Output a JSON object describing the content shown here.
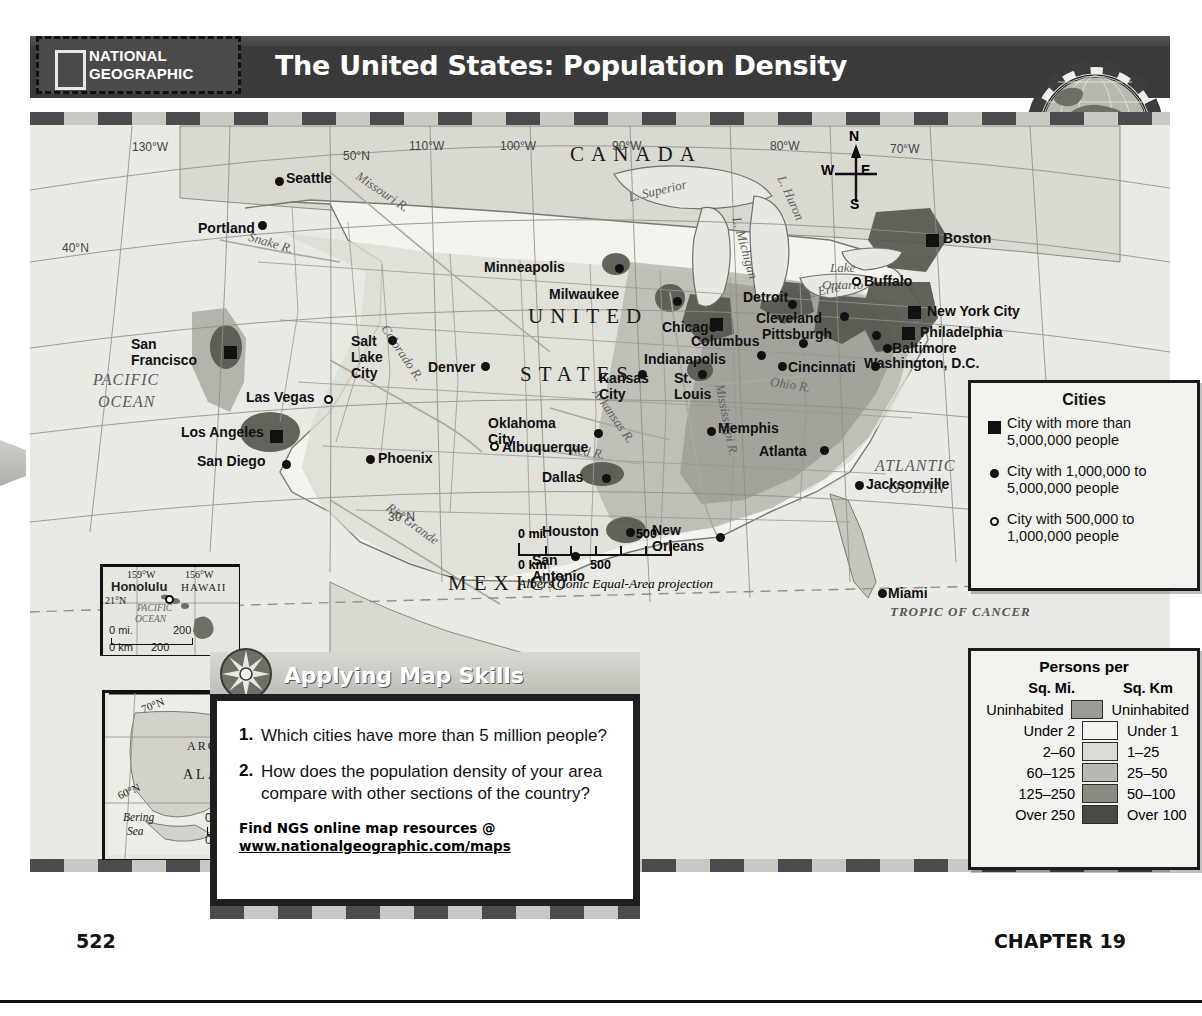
{
  "publisher": {
    "line1": "NATIONAL",
    "line2": "GEOGRAPHIC",
    "logo_icon": "ng-rectangle-logo"
  },
  "header": {
    "title": "The United States: Population Density"
  },
  "globe": {
    "icon": "globe-locator-icon"
  },
  "map": {
    "projection_note": "Albers Conic Equal-Area projection",
    "countries": [
      {
        "name": "CANADA",
        "x": 540,
        "y": 30
      },
      {
        "name": "UNITED",
        "x": 498,
        "y": 192
      },
      {
        "name": "STATES",
        "x": 490,
        "y": 250
      },
      {
        "name": "MEXICO",
        "x": 418,
        "y": 459
      }
    ],
    "oceans": [
      {
        "name": "PACIFIC",
        "x": 63,
        "y": 259
      },
      {
        "name": "OCEAN",
        "x": 68,
        "y": 281
      },
      {
        "name": "ATLANTIC",
        "x": 845,
        "y": 345
      },
      {
        "name": "OCEAN",
        "x": 858,
        "y": 367
      }
    ],
    "waters": [
      {
        "name": "L. Superior",
        "x": 598,
        "y": 71,
        "rot": -13
      },
      {
        "name": "L. Michigan",
        "x": 683,
        "y": 128,
        "rot": 74
      },
      {
        "name": "L. Huron",
        "x": 737,
        "y": 78,
        "rot": 66
      },
      {
        "name": "L. Erie",
        "x": 774,
        "y": 171,
        "rot": -12
      },
      {
        "name": "Lake",
        "x": 800,
        "y": 148,
        "rot": 0
      },
      {
        "name": "Ontario",
        "x": 792,
        "y": 165,
        "rot": 0
      },
      {
        "name": "Missouri R.",
        "x": 322,
        "y": 72,
        "rot": 34
      },
      {
        "name": "Snake R.",
        "x": 218,
        "y": 123,
        "rot": 16
      },
      {
        "name": "Colorado R.",
        "x": 340,
        "y": 233,
        "rot": 56
      },
      {
        "name": "Arkansas R.",
        "x": 552,
        "y": 296,
        "rot": 55
      },
      {
        "name": "Red R.",
        "x": 540,
        "y": 332,
        "rot": 10
      },
      {
        "name": "Mississippi R.",
        "x": 660,
        "y": 300,
        "rot": 79
      },
      {
        "name": "Ohio R.",
        "x": 740,
        "y": 265,
        "rot": 9
      },
      {
        "name": "Rio Grande",
        "x": 352,
        "y": 404,
        "rot": 36
      }
    ],
    "graticule": [
      {
        "label": "130°W",
        "x": 102,
        "y": 28
      },
      {
        "label": "50°N",
        "x": 313,
        "y": 37
      },
      {
        "label": "110°W",
        "x": 379,
        "y": 27
      },
      {
        "label": "100°W",
        "x": 470,
        "y": 27
      },
      {
        "label": "90°W",
        "x": 582,
        "y": 27
      },
      {
        "label": "80°W",
        "x": 740,
        "y": 27
      },
      {
        "label": "70°W",
        "x": 860,
        "y": 30
      },
      {
        "label": "40°N",
        "x": 32,
        "y": 129
      },
      {
        "label": "30°N",
        "x": 358,
        "y": 398
      },
      {
        "label": "TROPIC OF CANCER",
        "x": 860,
        "y": 492
      }
    ],
    "compass": {
      "n": "N",
      "e": "E",
      "s": "S",
      "w": "W",
      "x": 795,
      "y": 28
    },
    "scale": {
      "mi_zero": "0 mi.",
      "mi_max": "500",
      "km_zero": "0 km",
      "km_max": "500"
    },
    "cities": [
      {
        "name": "Seattle",
        "marker": "dot",
        "mx": 245,
        "my": 65,
        "lx": 256,
        "ly": 58
      },
      {
        "name": "Portland",
        "marker": "dot",
        "mx": 228,
        "my": 109,
        "lx": 168,
        "ly": 108
      },
      {
        "name": "San\nFrancisco",
        "marker": "sq",
        "mx": 194,
        "my": 234,
        "lx": 101,
        "ly": 224
      },
      {
        "name": "Los Angeles",
        "marker": "sq",
        "mx": 240,
        "my": 318,
        "lx": 151,
        "ly": 312
      },
      {
        "name": "San Diego",
        "marker": "dot",
        "mx": 252,
        "my": 348,
        "lx": 167,
        "ly": 341
      },
      {
        "name": "Las Vegas",
        "marker": "open",
        "mx": 294,
        "my": 283,
        "lx": 216,
        "ly": 277
      },
      {
        "name": "Salt\nLake\nCity",
        "marker": "dot",
        "mx": 358,
        "my": 224,
        "lx": 321,
        "ly": 221
      },
      {
        "name": "Phoenix",
        "marker": "dot",
        "mx": 336,
        "my": 343,
        "lx": 348,
        "ly": 338
      },
      {
        "name": "Albuquerque",
        "marker": "open",
        "mx": 460,
        "my": 330,
        "lx": 472,
        "ly": 327
      },
      {
        "name": "Denver",
        "marker": "dot",
        "mx": 451,
        "my": 250,
        "lx": 398,
        "ly": 247
      },
      {
        "name": "Minneapolis",
        "marker": "dot",
        "mx": 585,
        "my": 152,
        "lx": 454,
        "ly": 147
      },
      {
        "name": "Milwaukee",
        "marker": "dot",
        "mx": 643,
        "my": 185,
        "lx": 519,
        "ly": 174
      },
      {
        "name": "Chicago",
        "marker": "sq",
        "mx": 680,
        "my": 206,
        "lx": 632,
        "ly": 207
      },
      {
        "name": "Detroit",
        "marker": "dot",
        "mx": 758,
        "my": 188,
        "lx": 713,
        "ly": 177
      },
      {
        "name": "Indianapolis",
        "marker": "dot",
        "mx": 727,
        "my": 239,
        "lx": 614,
        "ly": 239
      },
      {
        "name": "Columbus",
        "marker": "dot",
        "mx": 769,
        "my": 227,
        "lx": 661,
        "ly": 221
      },
      {
        "name": "Cincinnati",
        "marker": "dot",
        "mx": 748,
        "my": 250,
        "lx": 758,
        "ly": 247
      },
      {
        "name": "Cleveland",
        "marker": "dot",
        "mx": 810,
        "my": 200,
        "lx": 726,
        "ly": 198
      },
      {
        "name": "Pittsburgh",
        "marker": "dot",
        "mx": 842,
        "my": 219,
        "lx": 732,
        "ly": 214
      },
      {
        "name": "Buffalo",
        "marker": "open",
        "mx": 822,
        "my": 165,
        "lx": 834,
        "ly": 161
      },
      {
        "name": "Boston",
        "marker": "sq",
        "mx": 896,
        "my": 122,
        "lx": 913,
        "ly": 118
      },
      {
        "name": "New York City",
        "marker": "sq",
        "mx": 878,
        "my": 194,
        "lx": 897,
        "ly": 191
      },
      {
        "name": "Philadelphia",
        "marker": "sq",
        "mx": 872,
        "my": 215,
        "lx": 890,
        "ly": 212
      },
      {
        "name": "Baltimore",
        "marker": "dot",
        "mx": 853,
        "my": 232,
        "lx": 862,
        "ly": 228
      },
      {
        "name": "Washington, D.C.",
        "marker": "dot",
        "mx": 841,
        "my": 250,
        "lx": 834,
        "ly": 243
      },
      {
        "name": "Kansas\nCity",
        "marker": "dot",
        "mx": 608,
        "my": 258,
        "lx": 569,
        "ly": 258
      },
      {
        "name": "St.\nLouis",
        "marker": "dot",
        "mx": 668,
        "my": 258,
        "lx": 644,
        "ly": 258
      },
      {
        "name": "Memphis",
        "marker": "dot",
        "mx": 677,
        "my": 315,
        "lx": 688,
        "ly": 308
      },
      {
        "name": "Oklahoma\nCity",
        "marker": "dot",
        "mx": 564,
        "my": 317,
        "lx": 458,
        "ly": 303
      },
      {
        "name": "Dallas",
        "marker": "dot",
        "mx": 572,
        "my": 362,
        "lx": 512,
        "ly": 357
      },
      {
        "name": "Houston",
        "marker": "dot",
        "mx": 596,
        "my": 416,
        "lx": 512,
        "ly": 411
      },
      {
        "name": "San\nAntonio",
        "marker": "dot",
        "mx": 541,
        "my": 440,
        "lx": 502,
        "ly": 440
      },
      {
        "name": "New\nOrleans",
        "marker": "dot",
        "mx": 686,
        "my": 421,
        "lx": 622,
        "ly": 410
      },
      {
        "name": "Atlanta",
        "marker": "dot",
        "mx": 790,
        "my": 334,
        "lx": 729,
        "ly": 331
      },
      {
        "name": "Jacksonville",
        "marker": "dot",
        "mx": 825,
        "my": 369,
        "lx": 836,
        "ly": 364
      },
      {
        "name": "Miami",
        "marker": "dot",
        "mx": 848,
        "my": 477,
        "lx": 858,
        "ly": 473
      }
    ]
  },
  "cities_legend": {
    "title": "Cities",
    "items": [
      {
        "symbol": "square",
        "line1": "City with more than",
        "line2": "5,000,000 people"
      },
      {
        "symbol": "dot",
        "line1": "City with 1,000,000 to",
        "line2": "5,000,000 people"
      },
      {
        "symbol": "open-circle",
        "line1": "City with 500,000 to",
        "line2": "1,000,000 people"
      }
    ]
  },
  "density_legend": {
    "title": "Persons per",
    "col_left": "Sq. Mi.",
    "col_right": "Sq. Km",
    "rows": [
      {
        "mi": "Uninhabited",
        "km": "Uninhabited",
        "color": "#9c9c96"
      },
      {
        "mi": "Under 2",
        "km": "Under 1",
        "color": "#f4f4ef"
      },
      {
        "mi": "2–60",
        "km": "1–25",
        "color": "#dcdcd4"
      },
      {
        "mi": "60–125",
        "km": "25–50",
        "color": "#b9b9b1"
      },
      {
        "mi": "125–250",
        "km": "50–100",
        "color": "#8a8a83"
      },
      {
        "mi": "Over 250",
        "km": "Over 100",
        "color": "#4a4a45"
      }
    ]
  },
  "skills": {
    "heading": "Applying Map Skills",
    "rose_icon": "compass-rose-icon",
    "questions": [
      {
        "num": "1.",
        "text": "Which cities have more than 5 million people?"
      },
      {
        "num": "2.",
        "text": "How does the population density of your area compare with other sections of the country?"
      }
    ],
    "ngs_line": "Find NGS online map resources @",
    "ngs_url": "www.nationalgeographic.com/maps"
  },
  "hawaii_inset": {
    "name": "HAWAII",
    "city": "Honolulu",
    "ocean1": "PACIFIC",
    "ocean2": "OCEAN",
    "lon1": "159°W",
    "lon2": "156°W",
    "lat": "21°N",
    "scale_mi0": "0 mi.",
    "scale_mi": "200",
    "scale_km0": "0 km",
    "scale_km": "200"
  },
  "alaska_inset": {
    "name": "ALASKA",
    "circle1": "ARCTIC",
    "circle2": "CIRCLE",
    "sea1": "Bering",
    "sea2": "Sea",
    "lat70": "70°N",
    "lat60": "60°N",
    "lon150": "150°W",
    "scale_mi0": "0 mi.",
    "scale_mi": "500",
    "scale_km0": "0 km",
    "scale_km": "500"
  },
  "footer": {
    "page_number": "522",
    "chapter": "CHAPTER 19"
  }
}
